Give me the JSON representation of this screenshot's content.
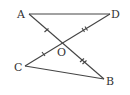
{
  "diagram": {
    "type": "geometry",
    "points": [
      {
        "id": "A",
        "label": "A",
        "x": 29,
        "y": 14
      },
      {
        "id": "D",
        "label": "D",
        "x": 110,
        "y": 14
      },
      {
        "id": "O",
        "label": "O",
        "x": 62,
        "y": 44
      },
      {
        "id": "C",
        "label": "C",
        "x": 25,
        "y": 66
      },
      {
        "id": "B",
        "label": "B",
        "x": 104,
        "y": 79
      }
    ],
    "segments": [
      "AD",
      "AB",
      "CD",
      "CB"
    ],
    "equal_marks": [
      {
        "segments": [
          "AO",
          "CO"
        ],
        "ticks": 1
      },
      {
        "segments": [
          "OD",
          "OB"
        ],
        "ticks": 2
      }
    ],
    "stroke_color": "#444444"
  }
}
